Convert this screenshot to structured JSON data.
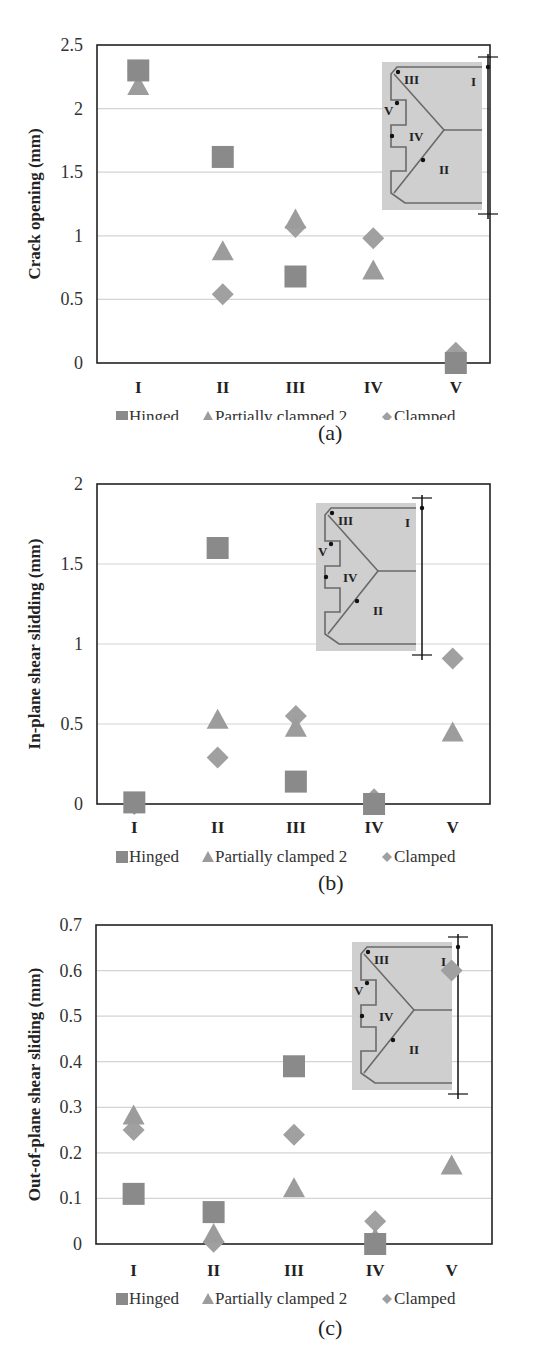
{
  "chart_data": [
    {
      "type": "scatter",
      "panel": "(a)",
      "title": "",
      "xlabel": "",
      "ylabel": "Crack opening (mm)",
      "categories": [
        "I",
        "II",
        "III",
        "IV",
        "V"
      ],
      "ylim": [
        0,
        2.5
      ],
      "yticks": [
        0,
        0.5,
        1,
        1.5,
        2,
        2.5
      ],
      "ytick_labels": [
        "0",
        "0.5",
        "1",
        "1.5",
        "2",
        "2.5"
      ],
      "grid": true,
      "legend_position": "bottom",
      "series": [
        {
          "name": "Hinged",
          "marker": "square",
          "values": [
            2.3,
            1.62,
            0.68,
            null,
            0.0
          ]
        },
        {
          "name": "Partially clamped 2",
          "marker": "triangle",
          "values": [
            2.17,
            0.87,
            1.12,
            0.72,
            0.02
          ]
        },
        {
          "name": "Clamped",
          "marker": "diamond",
          "values": [
            2.3,
            0.54,
            1.07,
            0.98,
            0.08
          ]
        }
      ],
      "inset": {
        "labels": [
          "I",
          "II",
          "III",
          "IV",
          "V"
        ]
      }
    },
    {
      "type": "scatter",
      "panel": "(b)",
      "title": "",
      "xlabel": "",
      "ylabel": "In-plane shear slidding (mm)",
      "categories": [
        "I",
        "II",
        "III",
        "IV",
        "V"
      ],
      "ylim": [
        0,
        2
      ],
      "yticks": [
        0,
        0.5,
        1,
        1.5,
        2
      ],
      "ytick_labels": [
        "0",
        "0.5",
        "1",
        "1.5",
        "2"
      ],
      "grid": true,
      "legend_position": "bottom",
      "series": [
        {
          "name": "Hinged",
          "marker": "square",
          "values": [
            0.01,
            1.6,
            0.14,
            0.0,
            null
          ]
        },
        {
          "name": "Partially clamped 2",
          "marker": "triangle",
          "values": [
            0.0,
            0.52,
            0.47,
            0.01,
            0.44
          ]
        },
        {
          "name": "Clamped",
          "marker": "diamond",
          "values": [
            0.0,
            0.29,
            0.55,
            0.03,
            0.91
          ]
        }
      ],
      "inset": {
        "labels": [
          "I",
          "II",
          "III",
          "IV",
          "V"
        ]
      }
    },
    {
      "type": "scatter",
      "panel": "(c)",
      "title": "",
      "xlabel": "",
      "ylabel": "Out-of-plane shear sliding (mm)",
      "categories": [
        "I",
        "II",
        "III",
        "IV",
        "V"
      ],
      "ylim": [
        0,
        0.7
      ],
      "yticks": [
        0,
        0.1,
        0.2,
        0.3,
        0.4,
        0.5,
        0.6,
        0.7
      ],
      "ytick_labels": [
        "0",
        "0.1",
        "0.2",
        "0.3",
        "0.4",
        "0.5",
        "0.6",
        "0.7"
      ],
      "grid": true,
      "legend_position": "bottom",
      "series": [
        {
          "name": "Hinged",
          "marker": "square",
          "values": [
            0.11,
            0.07,
            0.39,
            0.0,
            null
          ]
        },
        {
          "name": "Partially clamped 2",
          "marker": "triangle",
          "values": [
            0.28,
            0.02,
            0.12,
            0.01,
            0.17
          ]
        },
        {
          "name": "Clamped",
          "marker": "diamond",
          "values": [
            0.25,
            0.005,
            0.24,
            0.05,
            0.6
          ]
        }
      ],
      "inset": {
        "labels": [
          "I",
          "II",
          "III",
          "IV",
          "V"
        ]
      }
    }
  ],
  "legend": {
    "hinged": "Hinged",
    "partially_clamped": "Partially clamped 2",
    "clamped": "Clamped"
  },
  "captions": {
    "a": "(a)",
    "b": "(b)",
    "c": "(c)"
  },
  "colors": {
    "square": "#8a8a8a",
    "triangle": "#9c9c9c",
    "diamond": "#a0a0a0",
    "grid": "#d4d4d4",
    "axis": "#222222",
    "inset_bg": "#cfcfcf",
    "inset_line": "#6a6a6a"
  }
}
